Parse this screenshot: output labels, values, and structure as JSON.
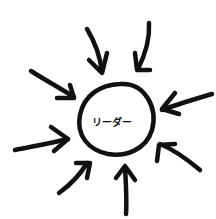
{
  "diagram": {
    "center_label": "リーダー",
    "center_shape": "circle",
    "arrow_count": 8,
    "arrow_direction": "inward",
    "stroke_color": "#111111",
    "background": "#ffffff"
  }
}
